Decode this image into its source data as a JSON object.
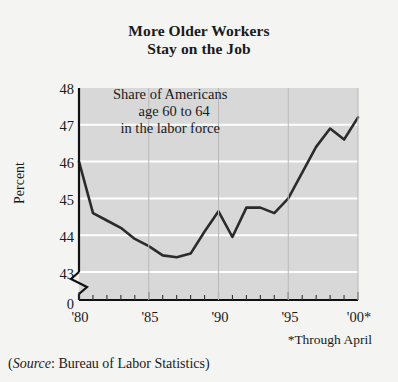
{
  "figure": {
    "title_line1": "More Older Workers",
    "title_line2": "Stay on the Job",
    "footnote": "*Through April",
    "source_prefix": "(",
    "source_label": "Source",
    "source_text": ": Bureau of Labor Statistics)",
    "background_color": "#f4f4f2",
    "plot_background_color": "#d8d8d8",
    "line_color": "#2b2b2b",
    "gridline_color": "#ffffff"
  },
  "annotation": {
    "line1": "Share of Americans",
    "line2": "age 60 to 64",
    "line3": "in the labor force"
  },
  "chart_data": {
    "type": "line",
    "title": "More Older Workers Stay on the Job",
    "subtitle": "Share of Americans age 60 to 64 in the labor force",
    "xlabel": "",
    "ylabel": "Percent",
    "ylim": [
      43,
      48
    ],
    "xlim": [
      1980,
      2000
    ],
    "yticks": [
      43,
      44,
      45,
      46,
      47,
      48
    ],
    "ytick_labels": [
      "43",
      "44",
      "45",
      "46",
      "47",
      "48"
    ],
    "y_axis_break": true,
    "y_axis_zero_label": "0",
    "xticks": [
      1980,
      1985,
      1990,
      1995,
      2000
    ],
    "xtick_labels": [
      "'80",
      "'85",
      "'90",
      "'95",
      "'00*"
    ],
    "grid": true,
    "legend": false,
    "series": [
      {
        "name": "Share of Americans age 60 to 64 in the labor force",
        "x": [
          1980,
          1981,
          1982,
          1983,
          1984,
          1985,
          1986,
          1987,
          1988,
          1989,
          1990,
          1991,
          1992,
          1993,
          1994,
          1995,
          1996,
          1997,
          1998,
          1999,
          2000
        ],
        "values": [
          46.0,
          44.6,
          44.4,
          44.2,
          43.9,
          43.7,
          43.45,
          43.4,
          43.5,
          44.1,
          44.65,
          43.95,
          44.75,
          44.75,
          44.6,
          45.0,
          45.7,
          46.4,
          46.9,
          46.6,
          47.2
        ]
      }
    ]
  }
}
